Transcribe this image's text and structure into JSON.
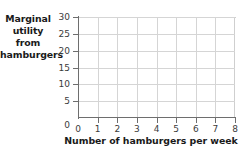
{
  "chart_data": {
    "type": "line",
    "title": "",
    "subtitle": "",
    "xlabel": "Number of hamburgers per week",
    "ylabel": "Marginal utility from hamburgers",
    "ylabel_lines": [
      "Marginal",
      "utility",
      "from",
      "hamburgers"
    ],
    "xlim": [
      0,
      8
    ],
    "ylim": [
      0,
      30
    ],
    "xticks": [
      0,
      1,
      2,
      3,
      4,
      5,
      6,
      7,
      8
    ],
    "yticks": [
      0,
      5,
      10,
      15,
      20,
      25,
      30
    ],
    "xtick_labels": [
      "0",
      "1",
      "2",
      "3",
      "4",
      "5",
      "6",
      "7",
      "8"
    ],
    "ytick_labels": [
      "0",
      "5",
      "10",
      "15",
      "20",
      "25",
      "30"
    ],
    "grid": true,
    "grid_axis": "both",
    "legend": null,
    "series": [],
    "annotations": []
  },
  "colors": {
    "background": "#ffffff",
    "axis": "#6e6e6e",
    "grid": "#d5d5d5",
    "tick_label": "#3b3b3b",
    "axis_title": "#1a1a1a"
  }
}
